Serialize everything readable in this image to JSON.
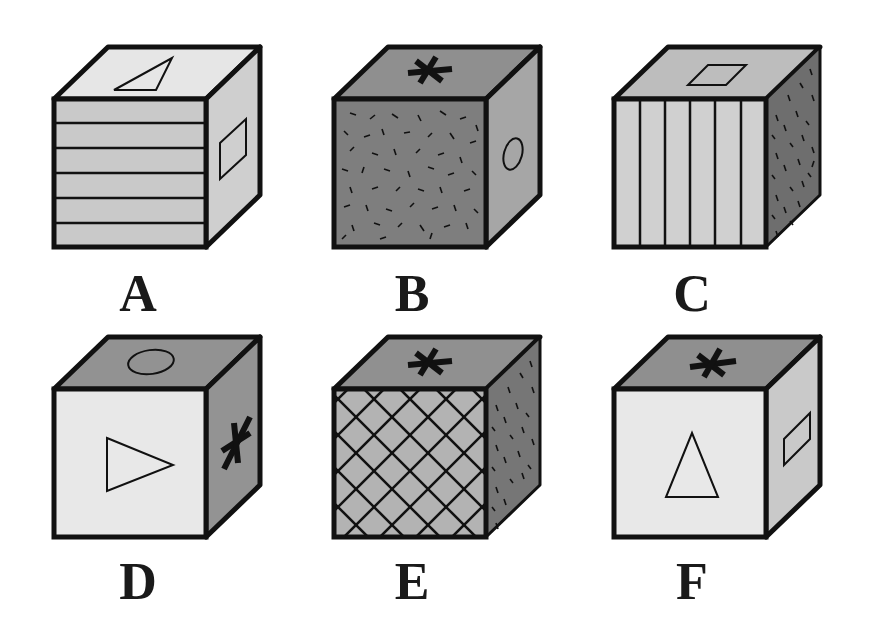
{
  "colors": {
    "light": "#e8e8e8",
    "medium": "#c8c8c8",
    "mid_dark": "#a9a9a9",
    "dark": "#8a8a8a",
    "stroke": "#111111"
  },
  "cubes": [
    {
      "label": "A",
      "front": "horizontal-stripes",
      "top": "triangle",
      "right": "rectangle"
    },
    {
      "label": "B",
      "front": "dashes-pattern",
      "top": "asterisk",
      "right": "circle"
    },
    {
      "label": "C",
      "front": "vertical-stripes",
      "top": "parallelogram",
      "right": "dots-pattern"
    },
    {
      "label": "D",
      "front": "right-pointing-triangle",
      "top": "circle",
      "right": "asterisk"
    },
    {
      "label": "E",
      "front": "diagonal-grid",
      "top": "asterisk",
      "right": "dots-pattern"
    },
    {
      "label": "F",
      "front": "upward-triangle",
      "top": "asterisk",
      "right": "rectangle"
    }
  ]
}
